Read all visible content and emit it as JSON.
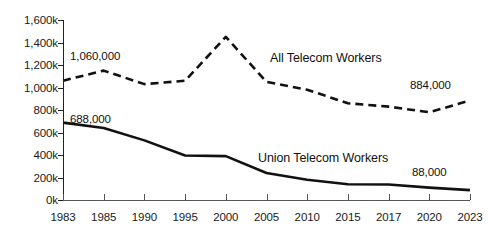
{
  "chart_data": {
    "type": "line",
    "title": "",
    "xlabel": "",
    "ylabel": "",
    "grid": false,
    "legend_position": "inline-annotation",
    "categories": [
      "1983",
      "1985",
      "1990",
      "1995",
      "2000",
      "2005",
      "2010",
      "2015",
      "2017",
      "2020",
      "2023"
    ],
    "ylim": [
      0,
      1600000
    ],
    "ytick_labels": [
      "1,600k",
      "1,400k",
      "1,200k",
      "1,000k",
      "800k",
      "600k",
      "400k",
      "200k",
      "0k"
    ],
    "ytick_values": [
      1600000,
      1400000,
      1200000,
      1000000,
      800000,
      600000,
      400000,
      200000,
      0
    ],
    "series": [
      {
        "name": "All Telecom Workers",
        "style": "dashed",
        "color": "#111111",
        "values": [
          1060000,
          1150000,
          1030000,
          1060000,
          1450000,
          1050000,
          980000,
          860000,
          830000,
          780000,
          884000
        ]
      },
      {
        "name": "Union Telecom Workers",
        "style": "solid",
        "color": "#111111",
        "values": [
          688000,
          640000,
          530000,
          395000,
          390000,
          240000,
          180000,
          140000,
          138000,
          110000,
          88000
        ]
      }
    ],
    "annotations": [
      {
        "text": "1,060,000",
        "series": "All Telecom Workers",
        "at_category": "1983"
      },
      {
        "text": "884,000",
        "series": "All Telecom Workers",
        "at_category": "2023"
      },
      {
        "text": "688,000",
        "series": "Union Telecom Workers",
        "at_category": "1983"
      },
      {
        "text": "88,000",
        "series": "Union Telecom Workers",
        "at_category": "2023"
      }
    ],
    "series_labels": [
      {
        "text": "All Telecom Workers"
      },
      {
        "text": "Union Telecom Workers"
      }
    ]
  }
}
